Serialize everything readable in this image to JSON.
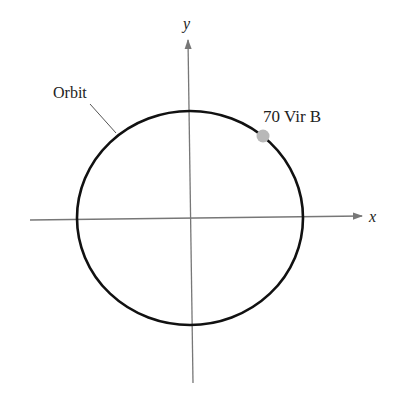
{
  "diagram": {
    "axes": {
      "x_label": "x",
      "y_label": "y",
      "axis_color": "#777777"
    },
    "orbit": {
      "label": "Orbit",
      "stroke_color": "#111111",
      "center": [
        190,
        218
      ],
      "rx": 113,
      "ry": 107
    },
    "planet": {
      "label": "70 Vir B",
      "color": "#b8b8b8",
      "position": [
        263,
        136
      ]
    }
  }
}
